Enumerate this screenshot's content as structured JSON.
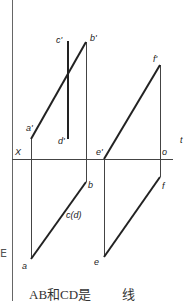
{
  "diagram": {
    "type": "orthographic-projection",
    "axis_label_x": "X",
    "axis_label_o": "o",
    "edge_label_right": "t",
    "points": {
      "a_prime": "a'",
      "b_prime": "b'",
      "c_prime": "c'",
      "d_prime": "d'",
      "a": "a",
      "b": "b",
      "cd": "c(d)",
      "e_prime": "e'",
      "f_prime": "f'",
      "e": "e",
      "f": "f"
    }
  },
  "caption": {
    "left": "AB和CD是",
    "right": "线"
  },
  "left_edge_text": "E",
  "colors": {
    "line": "#222222",
    "thin_line": "#444444",
    "border": "#555555"
  }
}
